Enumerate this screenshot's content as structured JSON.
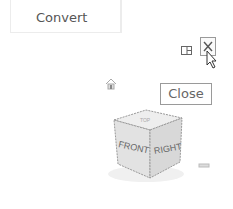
{
  "ribbon": {
    "convert_label": "Convert",
    "ghost_text": "░░░░"
  },
  "window_controls": {
    "tile_icon": "tile-windows-icon",
    "close_icon": "close-icon"
  },
  "tooltip": {
    "text": "Close"
  },
  "viewcube": {
    "front_label": "FRONT",
    "right_label": "RIGHT",
    "top_label": "TOP",
    "home_icon": "home-icon"
  },
  "colors": {
    "border": "#9a9a9a",
    "text": "#555555",
    "cube_face": "#e6e6e6"
  }
}
